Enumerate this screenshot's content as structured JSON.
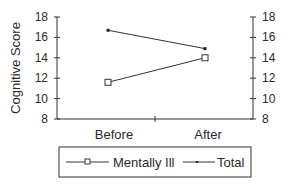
{
  "chart_data": {
    "type": "line",
    "title": "",
    "xlabel": "",
    "ylabel": "Cognitive Score",
    "y2label": "",
    "categories": [
      "Before",
      "After"
    ],
    "series": [
      {
        "name": "Mentally Ill",
        "marker": "open-square",
        "values": [
          11.6,
          14.0
        ]
      },
      {
        "name": "Total",
        "marker": "small-filled-square",
        "values": [
          16.7,
          14.9
        ]
      }
    ],
    "ylim": [
      8,
      18
    ],
    "y_ticks": [
      8,
      10,
      12,
      14,
      16,
      18
    ],
    "y2_ticks": [
      8,
      10,
      12,
      14,
      16,
      18
    ],
    "grid": false,
    "legend_position": "bottom",
    "colors": {
      "line": "#333333",
      "text": "#2a2a2a",
      "background": "#ffffff"
    }
  }
}
